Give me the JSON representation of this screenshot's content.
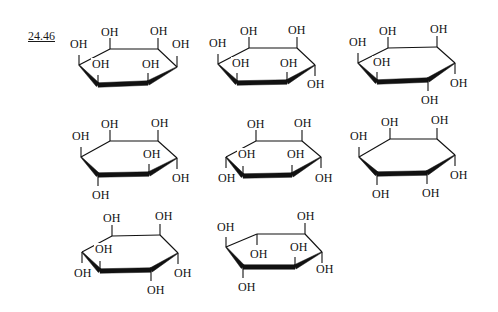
{
  "figure": {
    "label": "24.46"
  },
  "structures": [
    {
      "id": 1,
      "ring": [
        [
          79,
          65
        ],
        [
          110,
          49
        ],
        [
          158,
          49
        ],
        [
          177,
          67
        ],
        [
          148,
          83
        ],
        [
          98,
          85
        ]
      ],
      "bonds": [
        [
          [
            79,
            65
          ],
          [
            79,
            55
          ]
        ],
        [
          [
            110,
            49
          ],
          [
            110,
            38
          ]
        ],
        [
          [
            158,
            49
          ],
          [
            158,
            38
          ]
        ],
        [
          [
            177,
            67
          ],
          [
            177,
            56
          ]
        ],
        [
          [
            98,
            85
          ],
          [
            98,
            75
          ]
        ],
        [
          [
            148,
            83
          ],
          [
            148,
            73
          ]
        ]
      ],
      "labels": [
        {
          "text": "OH",
          "x": 70,
          "y": 48
        },
        {
          "text": "OH",
          "x": 101,
          "y": 36
        },
        {
          "text": "OH",
          "x": 150,
          "y": 35
        },
        {
          "text": "OH",
          "x": 172,
          "y": 48
        },
        {
          "text": "OH",
          "x": 92,
          "y": 68
        },
        {
          "text": "OH",
          "x": 142,
          "y": 68
        }
      ]
    },
    {
      "id": 2,
      "ring": [
        [
          218,
          64
        ],
        [
          249,
          48
        ],
        [
          297,
          48
        ],
        [
          315,
          65
        ],
        [
          287,
          82
        ],
        [
          237,
          83
        ]
      ],
      "bonds": [
        [
          [
            218,
            64
          ],
          [
            218,
            54
          ]
        ],
        [
          [
            249,
            48
          ],
          [
            249,
            37
          ]
        ],
        [
          [
            297,
            48
          ],
          [
            297,
            37
          ]
        ],
        [
          [
            315,
            65
          ],
          [
            315,
            76
          ]
        ],
        [
          [
            237,
            83
          ],
          [
            237,
            73
          ]
        ],
        [
          [
            287,
            82
          ],
          [
            287,
            72
          ]
        ]
      ],
      "labels": [
        {
          "text": "OH",
          "x": 209,
          "y": 47
        },
        {
          "text": "OH",
          "x": 240,
          "y": 35
        },
        {
          "text": "OH",
          "x": 288,
          "y": 34
        },
        {
          "text": "OH",
          "x": 307,
          "y": 88
        },
        {
          "text": "OH",
          "x": 232,
          "y": 67
        },
        {
          "text": "OH",
          "x": 280,
          "y": 67
        }
      ]
    },
    {
      "id": 3,
      "ring": [
        [
          358,
          63
        ],
        [
          388,
          48
        ],
        [
          437,
          47
        ],
        [
          455,
          63
        ],
        [
          428,
          80
        ],
        [
          377,
          82
        ]
      ],
      "bonds": [
        [
          [
            358,
            63
          ],
          [
            358,
            53
          ]
        ],
        [
          [
            388,
            48
          ],
          [
            388,
            37
          ]
        ],
        [
          [
            437,
            47
          ],
          [
            437,
            36
          ]
        ],
        [
          [
            455,
            63
          ],
          [
            455,
            74
          ]
        ],
        [
          [
            428,
            80
          ],
          [
            428,
            91
          ]
        ],
        [
          [
            377,
            82
          ],
          [
            377,
            72
          ]
        ]
      ],
      "labels": [
        {
          "text": "OH",
          "x": 349,
          "y": 46
        },
        {
          "text": "OH",
          "x": 379,
          "y": 35
        },
        {
          "text": "OH",
          "x": 430,
          "y": 33
        },
        {
          "text": "OH",
          "x": 450,
          "y": 87
        },
        {
          "text": "OH",
          "x": 421,
          "y": 104
        },
        {
          "text": "OH",
          "x": 373,
          "y": 66
        }
      ]
    },
    {
      "id": 4,
      "ring": [
        [
          81,
          157
        ],
        [
          110,
          141
        ],
        [
          158,
          141
        ],
        [
          177,
          158
        ],
        [
          149,
          174
        ],
        [
          98,
          175
        ]
      ],
      "bonds": [
        [
          [
            81,
            157
          ],
          [
            81,
            147
          ]
        ],
        [
          [
            110,
            141
          ],
          [
            110,
            130
          ]
        ],
        [
          [
            158,
            141
          ],
          [
            158,
            130
          ]
        ],
        [
          [
            177,
            158
          ],
          [
            177,
            169
          ]
        ],
        [
          [
            149,
            174
          ],
          [
            149,
            164
          ]
        ],
        [
          [
            98,
            175
          ],
          [
            98,
            186
          ]
        ]
      ],
      "labels": [
        {
          "text": "OH",
          "x": 72,
          "y": 140
        },
        {
          "text": "OH",
          "x": 101,
          "y": 128
        },
        {
          "text": "OH",
          "x": 151,
          "y": 127
        },
        {
          "text": "OH",
          "x": 172,
          "y": 182
        },
        {
          "text": "OH",
          "x": 143,
          "y": 158
        },
        {
          "text": "OH",
          "x": 92,
          "y": 199
        }
      ]
    },
    {
      "id": 5,
      "ring": [
        [
          226,
          157
        ],
        [
          256,
          141
        ],
        [
          302,
          141
        ],
        [
          321,
          157
        ],
        [
          292,
          175
        ],
        [
          243,
          176
        ]
      ],
      "bonds": [
        [
          [
            226,
            157
          ],
          [
            226,
            168
          ]
        ],
        [
          [
            256,
            141
          ],
          [
            256,
            130
          ]
        ],
        [
          [
            302,
            141
          ],
          [
            302,
            130
          ]
        ],
        [
          [
            321,
            157
          ],
          [
            321,
            168
          ]
        ],
        [
          [
            292,
            175
          ],
          [
            292,
            165
          ]
        ],
        [
          [
            243,
            176
          ],
          [
            243,
            166
          ]
        ]
      ],
      "labels": [
        {
          "text": "OH",
          "x": 218,
          "y": 182
        },
        {
          "text": "OH",
          "x": 247,
          "y": 128
        },
        {
          "text": "OH",
          "x": 294,
          "y": 127
        },
        {
          "text": "OH",
          "x": 315,
          "y": 182
        },
        {
          "text": "OH",
          "x": 287,
          "y": 158
        },
        {
          "text": "OH",
          "x": 238,
          "y": 158
        }
      ]
    },
    {
      "id": 6,
      "ring": [
        [
          359,
          157
        ],
        [
          390,
          139
        ],
        [
          437,
          139
        ],
        [
          455,
          155
        ],
        [
          427,
          173
        ],
        [
          377,
          174
        ]
      ],
      "bonds": [
        [
          [
            359,
            157
          ],
          [
            359,
            147
          ]
        ],
        [
          [
            390,
            139
          ],
          [
            390,
            128
          ]
        ],
        [
          [
            437,
            139
          ],
          [
            437,
            128
          ]
        ],
        [
          [
            455,
            155
          ],
          [
            455,
            166
          ]
        ],
        [
          [
            427,
            173
          ],
          [
            427,
            184
          ]
        ],
        [
          [
            377,
            174
          ],
          [
            377,
            185
          ]
        ]
      ],
      "labels": [
        {
          "text": "OH",
          "x": 350,
          "y": 140
        },
        {
          "text": "OH",
          "x": 381,
          "y": 126
        },
        {
          "text": "OH",
          "x": 431,
          "y": 124
        },
        {
          "text": "OH",
          "x": 450,
          "y": 179
        },
        {
          "text": "OH",
          "x": 422,
          "y": 197
        },
        {
          "text": "OH",
          "x": 372,
          "y": 198
        }
      ]
    },
    {
      "id": 7,
      "ring": [
        [
          82,
          252
        ],
        [
          112,
          236
        ],
        [
          160,
          235
        ],
        [
          178,
          253
        ],
        [
          151,
          270
        ],
        [
          100,
          271
        ]
      ],
      "bonds": [
        [
          [
            82,
            252
          ],
          [
            82,
            263
          ]
        ],
        [
          [
            112,
            236
          ],
          [
            112,
            225
          ]
        ],
        [
          [
            160,
            235
          ],
          [
            160,
            224
          ]
        ],
        [
          [
            178,
            253
          ],
          [
            178,
            264
          ]
        ],
        [
          [
            151,
            270
          ],
          [
            151,
            281
          ]
        ],
        [
          [
            100,
            271
          ],
          [
            100,
            261
          ]
        ]
      ],
      "labels": [
        {
          "text": "OH",
          "x": 74,
          "y": 277
        },
        {
          "text": "OH",
          "x": 103,
          "y": 222
        },
        {
          "text": "OH",
          "x": 155,
          "y": 220
        },
        {
          "text": "OH",
          "x": 174,
          "y": 277
        },
        {
          "text": "OH",
          "x": 147,
          "y": 294
        },
        {
          "text": "OH",
          "x": 95,
          "y": 253
        }
      ]
    },
    {
      "id": 8,
      "ring": [
        [
          226,
          247
        ],
        [
          257,
          234
        ],
        [
          305,
          234
        ],
        [
          322,
          252
        ],
        [
          295,
          267
        ],
        [
          243,
          267
        ]
      ],
      "bonds": [
        [
          [
            226,
            247
          ],
          [
            226,
            237
          ]
        ],
        [
          [
            257,
            234
          ],
          [
            257,
            245
          ]
        ],
        [
          [
            305,
            234
          ],
          [
            305,
            223
          ]
        ],
        [
          [
            322,
            252
          ],
          [
            322,
            263
          ]
        ],
        [
          [
            295,
            267
          ],
          [
            295,
            257
          ]
        ],
        [
          [
            243,
            267
          ],
          [
            243,
            278
          ]
        ]
      ],
      "labels": [
        {
          "text": "OH",
          "x": 217,
          "y": 231
        },
        {
          "text": "OH",
          "x": 250,
          "y": 258
        },
        {
          "text": "OH",
          "x": 297,
          "y": 220
        },
        {
          "text": "OH",
          "x": 316,
          "y": 273
        },
        {
          "text": "OH",
          "x": 290,
          "y": 251
        },
        {
          "text": "OH",
          "x": 238,
          "y": 291
        }
      ]
    }
  ]
}
